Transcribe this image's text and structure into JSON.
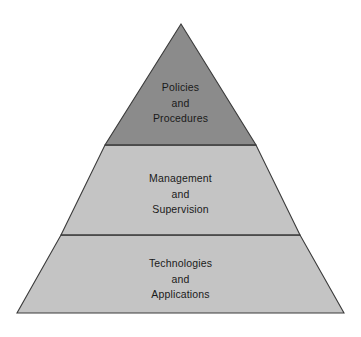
{
  "diagram": {
    "type": "pyramid",
    "background_color": "#ffffff",
    "outline_color": "#3b3b3b",
    "text_color": "#1a1a1a",
    "apex": {
      "x": 181,
      "y": 24
    },
    "base_left": {
      "x": 17,
      "y": 313
    },
    "base_right": {
      "x": 344,
      "y": 313
    },
    "tiers": [
      {
        "id": "top",
        "name": "policies-and-procedures",
        "fill_color": "#8b8b8b",
        "lines": [
          "Policies",
          "and",
          "Procedures"
        ],
        "line1": "Policies",
        "line2": "and",
        "line3": "Procedures",
        "divider_y": 145,
        "divider_left_x": 105,
        "divider_right_x": 256
      },
      {
        "id": "middle",
        "name": "management-and-supervision",
        "fill_color": "#c4c4c4",
        "lines": [
          "Management",
          "and",
          "Supervision"
        ],
        "line1": "Management",
        "line2": "and",
        "line3": "Supervision",
        "divider_y": 235,
        "divider_left_x": 61,
        "divider_right_x": 300
      },
      {
        "id": "bottom",
        "name": "technologies-and-applications",
        "fill_color": "#c4c4c4",
        "lines": [
          "Technologies",
          "and",
          "Applications"
        ],
        "line1": "Technologies",
        "line2": "and",
        "line3": "Applications",
        "divider_y": null,
        "divider_left_x": null,
        "divider_right_x": null
      }
    ]
  }
}
